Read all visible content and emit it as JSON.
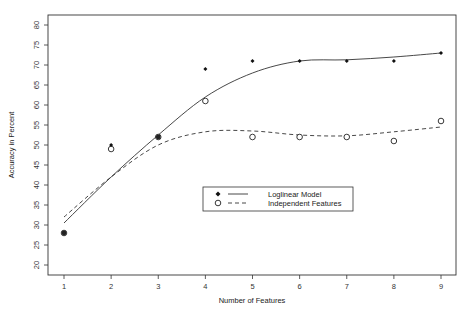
{
  "chart_data": {
    "type": "line",
    "title": "",
    "xlabel": "Number of Features",
    "ylabel": "Accuracy in Percent",
    "x": [
      1,
      2,
      3,
      4,
      5,
      6,
      7,
      8,
      9
    ],
    "xticks": [
      1,
      2,
      3,
      4,
      5,
      6,
      7,
      8,
      9
    ],
    "yticks": [
      20,
      25,
      30,
      35,
      40,
      45,
      50,
      55,
      60,
      65,
      70,
      75,
      80
    ],
    "xlim": [
      0.7,
      9.3
    ],
    "ylim": [
      17.5,
      82.5
    ],
    "grid": false,
    "legend_position": "inside-center-lower",
    "series": [
      {
        "name": "Loglinear Model",
        "marker": "filled-diamond",
        "line_style": "solid",
        "values": [
          28,
          50,
          52,
          69,
          71,
          71,
          71,
          71,
          73
        ],
        "smooth_curve": [
          30.5,
          42,
          52.5,
          62,
          68,
          71,
          71.3,
          72,
          73
        ]
      },
      {
        "name": "Independent Features",
        "marker": "open-circle",
        "line_style": "dashed",
        "values": [
          28,
          49,
          52,
          61,
          52,
          52,
          52,
          51,
          56
        ],
        "smooth_curve": [
          32,
          42,
          50,
          53.3,
          53.5,
          52.5,
          52.3,
          53.3,
          54.5
        ]
      }
    ]
  },
  "legend": {
    "items": [
      {
        "label": "Loglinear Model"
      },
      {
        "label": "Independent Features"
      }
    ]
  },
  "axes": {
    "xlabel": "Number of Features",
    "ylabel": "Accuracy in Percent"
  }
}
